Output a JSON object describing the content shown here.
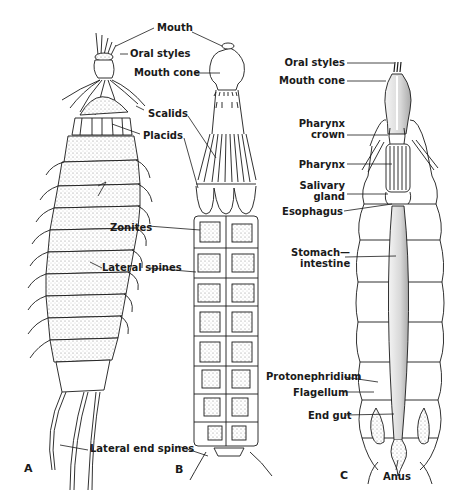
{
  "figure": {
    "panels": [
      {
        "id": "A",
        "label": "A"
      },
      {
        "id": "B",
        "label": "B"
      },
      {
        "id": "C",
        "label": "C"
      }
    ],
    "labels_ab": {
      "mouth": "Mouth",
      "oral_styles": "Oral styles",
      "mouth_cone": "Mouth cone",
      "scalids": "Scalids",
      "placids": "Placids",
      "zonites": "Zonites",
      "lateral_spines": "Lateral spines",
      "lateral_end_spines": "Lateral end spines"
    },
    "labels_c": {
      "oral_styles": "Oral styles",
      "mouth_cone": "Mouth cone",
      "pharynx_crown_1": "Pharynx",
      "pharynx_crown_2": "crown",
      "pharynx": "Pharynx",
      "salivary_gland_1": "Salivary",
      "salivary_gland_2": "gland",
      "esophagus": "Esophagus",
      "stomach_intestine_1": "Stomach—",
      "stomach_intestine_2": "intestine",
      "protonephridium": "Protonephridium",
      "flagellum": "Flagellum",
      "end_gut": "End gut",
      "anus": "Anus"
    },
    "colors": {
      "ink": "#1a1a1a",
      "stipple": "#cfcfcf",
      "background": "#ffffff"
    }
  }
}
